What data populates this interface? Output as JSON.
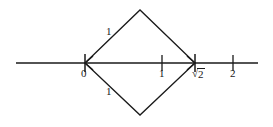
{
  "figure": {
    "background_color": "#ffffff",
    "stroke_color": "#1a1a1a",
    "width": 273,
    "height": 127
  },
  "number_line": {
    "name": "real-number-line",
    "y": 63,
    "x_start": 16,
    "x_end": 258,
    "ticks": [
      {
        "label": "0",
        "x": 85,
        "label_x": 81,
        "label_y": 68,
        "has_arrow": true,
        "arrow_direction": "left"
      },
      {
        "label": "1",
        "x": 162,
        "label_x": 159,
        "label_y": 68,
        "has_arrow": false,
        "arrow_direction": ""
      },
      {
        "label": "2",
        "x": 233,
        "label_x": 230,
        "label_y": 68,
        "has_arrow": false,
        "arrow_direction": ""
      }
    ],
    "marked_point": {
      "label": "√2",
      "radical": "√",
      "radicand": "2",
      "x": 195,
      "label_x": 192,
      "label_y": 68,
      "has_arrow": true,
      "arrow_direction": "right"
    }
  },
  "square": {
    "name": "unit-square-diamond",
    "vertices": [
      {
        "name": "left-vertex-origin",
        "x": 85,
        "y": 63
      },
      {
        "name": "top-vertex",
        "x": 140,
        "y": 10
      },
      {
        "name": "right-vertex-sqrt2",
        "x": 195,
        "y": 63
      },
      {
        "name": "bottom-vertex",
        "x": 140,
        "y": 115
      }
    ],
    "side_labels": [
      {
        "text": "1",
        "x": 106,
        "y": 26,
        "edge": "upper-left"
      },
      {
        "text": "1",
        "x": 106,
        "y": 86,
        "edge": "lower-left"
      }
    ]
  }
}
